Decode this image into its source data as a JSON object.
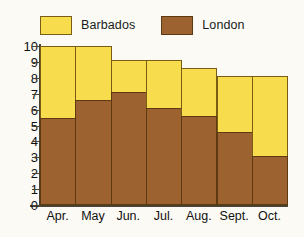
{
  "legend": {
    "entries": [
      {
        "label": "Barbados",
        "color": "#f7dc4e",
        "swatch_name": "legend-swatch-barbados"
      },
      {
        "label": "London",
        "color": "#9c6230",
        "swatch_name": "legend-swatch-london"
      }
    ]
  },
  "axes": {
    "y_ticks": [
      "10",
      "9",
      "8",
      "7",
      "6",
      "5",
      "4",
      "3",
      "2",
      "1",
      "0"
    ],
    "x_ticks": [
      "Apr.",
      "May",
      "Jun.",
      "Jul.",
      "Aug.",
      "Sept.",
      "Oct."
    ]
  },
  "colors": {
    "barbados": "#f7dc4e",
    "london": "#9c6230",
    "outline": "#6d4a16",
    "axis": "#4a4332",
    "background": "#fbfaf5",
    "text": "#111111"
  },
  "chart_data": {
    "type": "bar",
    "stacked": true,
    "title": "",
    "subtitle": "",
    "xlabel": "",
    "ylabel": "",
    "ylim": [
      0,
      10
    ],
    "ytick_step": 1,
    "grid": false,
    "legend_position": "top-left",
    "categories": [
      "Apr.",
      "May",
      "Jun.",
      "Jul.",
      "Aug.",
      "Sept.",
      "Oct."
    ],
    "series": [
      {
        "name": "London",
        "color": "#9c6230",
        "values": [
          5.5,
          6.6,
          7.1,
          6.1,
          5.6,
          4.6,
          3.1
        ]
      },
      {
        "name": "Barbados",
        "color": "#f7dc4e",
        "values": [
          4.5,
          3.4,
          2.0,
          3.0,
          3.0,
          3.5,
          5.0
        ]
      }
    ],
    "totals": [
      10.0,
      10.0,
      9.1,
      9.1,
      8.6,
      8.1,
      8.1
    ]
  }
}
